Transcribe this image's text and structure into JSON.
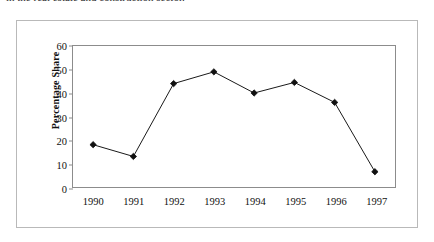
{
  "caption": {
    "text": "in the real estate and construction sector."
  },
  "chart_data": {
    "type": "line",
    "title": "",
    "xlabel": "",
    "ylabel": "Percentage Share",
    "categories": [
      "1990",
      "1991",
      "1992",
      "1993",
      "1994",
      "1995",
      "1996",
      "1997"
    ],
    "values": [
      18,
      13,
      44,
      49,
      40,
      44.5,
      36,
      6.5
    ],
    "series": [
      {
        "name": "Percentage Share",
        "values": [
          18,
          13,
          44,
          49,
          40,
          44.5,
          36,
          6.5
        ]
      }
    ],
    "ylim": [
      0,
      60
    ],
    "y_ticks": [
      0,
      10,
      20,
      30,
      40,
      50,
      60
    ],
    "y_tick_labels": [
      "0",
      "10",
      "20",
      "30",
      "40",
      "50",
      "60"
    ],
    "grid": false,
    "legend": false,
    "legend_position": "none",
    "marker": "diamond",
    "line_color": "#1a1a1a",
    "marker_color": "#111111",
    "axis_color": "#8c8c8c",
    "frame_color": "#b9b9b9",
    "background": "#ffffff"
  }
}
